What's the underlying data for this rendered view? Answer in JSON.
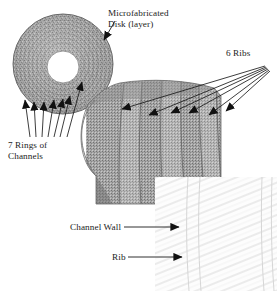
{
  "figure": {
    "kind": "annotated-micrograph-diagram",
    "background_color": "#ffffff",
    "ink_color": "#1c1c1c",
    "disk_fill": "#9a9a9a",
    "sector_fill": "#9d9d9d",
    "inset_fill": "#fbfbfb"
  },
  "labels": {
    "disk": {
      "line1": "Microfabricated",
      "line2": "Disk (layer)"
    },
    "ribs": {
      "text": "6 Ribs",
      "count": 6
    },
    "rings": {
      "line1": "7 Rings of",
      "line2": "Channels",
      "count": 7
    },
    "channel_wall": {
      "text": "Channel Wall"
    },
    "rib": {
      "text": "Rib"
    }
  },
  "parts": {
    "disk": {
      "name": "microfabricated-disk",
      "center_x": 63,
      "center_y": 64,
      "outer_radius": 50,
      "hole_center_x": 63,
      "hole_center_y": 67,
      "hole_radius": 16
    },
    "sector": {
      "name": "magnified-sector",
      "left": 88,
      "top": 82,
      "width": 133,
      "height": 122,
      "rib_count": 6
    },
    "inset": {
      "name": "channel-wall-inset",
      "left": 155,
      "top": 177,
      "width": 122,
      "height": 114
    }
  },
  "leaders": {
    "disk_arrow": {
      "from_x": 114,
      "from_y": 22,
      "to_x": 102,
      "to_y": 43
    },
    "ribs_arrow_origin": {
      "x": 266,
      "y": 66
    },
    "ribs_arrow_tips": [
      {
        "x": 118,
        "y": 110
      },
      {
        "x": 145,
        "y": 116
      },
      {
        "x": 167,
        "y": 114
      },
      {
        "x": 185,
        "y": 114
      },
      {
        "x": 205,
        "y": 116
      },
      {
        "x": 222,
        "y": 112
      }
    ],
    "rings_arrow_origin": {
      "x": 40,
      "y": 138
    },
    "rings_arrow_tips": [
      {
        "x": 24,
        "y": 97
      },
      {
        "x": 33,
        "y": 99
      },
      {
        "x": 43,
        "y": 99
      },
      {
        "x": 53,
        "y": 97
      },
      {
        "x": 62,
        "y": 96
      },
      {
        "x": 68,
        "y": 93
      },
      {
        "x": 79,
        "y": 79
      }
    ],
    "channel_wall_arrow": {
      "from_x": 122,
      "from_y": 227,
      "to_x": 181,
      "to_y": 227
    },
    "rib_arrow": {
      "from_x": 126,
      "from_y": 257,
      "to_x": 184,
      "to_y": 257
    }
  }
}
